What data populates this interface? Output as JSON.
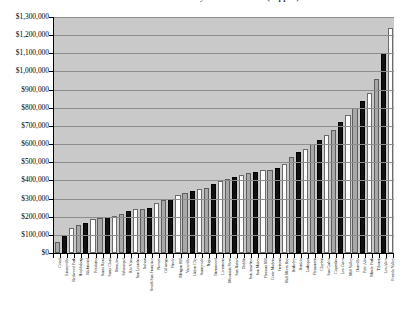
{
  "chart": {
    "title": "Median Home Prices in Bay Area Cities 2005 (clipped)",
    "ylabel": "",
    "xlabel": ""
  },
  "chart_data": {
    "type": "bar",
    "title": "Median Home Prices in Bay Area Cities 2005 (clipped)",
    "xlabel": "",
    "ylabel": "",
    "ylim": [
      0,
      1300000
    ],
    "grid": true,
    "legend": "none",
    "y_ticks": [
      "$0",
      "$100,000",
      "$200,000",
      "$300,000",
      "$400,000",
      "$500,000",
      "$600,000",
      "$700,000",
      "$800,000",
      "$900,000",
      "$1,000,000",
      "$1,100,000",
      "$1,200,000",
      "$1,300,000"
    ],
    "y_tick_values": [
      0,
      100000,
      200000,
      300000,
      400000,
      500000,
      600000,
      700000,
      800000,
      900000,
      1000000,
      1100000,
      1200000,
      1300000
    ],
    "bar_colors": [
      "#a8a8a8",
      "#111111",
      "#fdfdfd"
    ],
    "categories": [
      "Cotati",
      "Emeryville",
      "Redwood Park",
      "Healdsburg",
      "Richmond",
      "Petaluma",
      "Santa Rosa",
      "Santa Clara",
      "Hercules",
      "Sebastopol",
      "Rio Vista",
      "San Leandro",
      "Suisun",
      "South San Francisco",
      "Novato",
      "Calistoga",
      "Pinole",
      "Morgan Hill",
      "Vacaville",
      "Union City",
      "Sunnyvale",
      "Napa",
      "Brentwood",
      "Livermore",
      "Mountain View",
      "San Rafael",
      "Dublin",
      "San Anselmo",
      "San Mateo",
      "Pleasant Hill",
      "Corte Madera",
      "Fremont",
      "Half Moon Bay",
      "Berkeley",
      "Benicia",
      "Larkspur",
      "Pleasanton",
      "Clayton",
      "San Carlos",
      "Cupertino",
      "Los Gatos",
      "Mill Valley",
      "Danville",
      "Palo Alto",
      "Menlo Park",
      "Tiburon",
      "Los Altos",
      "Portola Valley"
    ],
    "values": [
      60000,
      95000,
      140000,
      155000,
      165000,
      185000,
      195000,
      200000,
      205000,
      215000,
      230000,
      240000,
      245000,
      250000,
      275000,
      290000,
      300000,
      320000,
      330000,
      340000,
      350000,
      360000,
      380000,
      395000,
      410000,
      420000,
      430000,
      440000,
      445000,
      455000,
      460000,
      470000,
      490000,
      530000,
      555000,
      575000,
      600000,
      620000,
      650000,
      680000,
      720000,
      760000,
      800000,
      840000,
      880000,
      960000,
      1100000,
      1240000
    ]
  }
}
